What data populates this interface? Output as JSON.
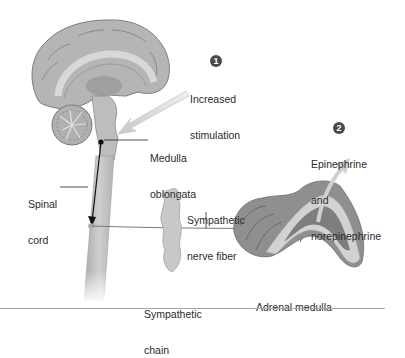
{
  "figure": {
    "steps": [
      {
        "number": "1",
        "label_line1": "Increased",
        "label_line2": "stimulation"
      },
      {
        "number": "2",
        "label_line1": "Epinephrine",
        "label_line2": "and",
        "label_line3": "norepinephrine"
      }
    ],
    "labels": {
      "medulla_line1": "Medulla",
      "medulla_line2": "oblongata",
      "spinal_line1": "Spinal",
      "spinal_line2": "cord",
      "nerve_line1": "Sympathetic",
      "nerve_line2": "nerve fiber",
      "chain_line1": "Sympathetic",
      "chain_line2": "chain",
      "adrenal": "Adrenal medulla"
    },
    "colors": {
      "brain": "#b8b8b8",
      "brain_dark": "#8e8e8e",
      "spinal": "#c4c4c4",
      "adrenal_cortex": "#c9c9c9",
      "adrenal_medulla": "#8a8a8a",
      "arrow": "#d4d4d4",
      "badge": "#4a4a4a",
      "text": "#2b2b2b"
    }
  }
}
